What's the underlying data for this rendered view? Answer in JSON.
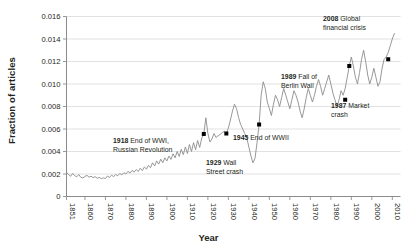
{
  "chart_data": {
    "type": "line",
    "title": "",
    "xlabel": "Year",
    "ylabel": "Fraction of articles",
    "xlim": [
      1851,
      2014
    ],
    "ylim": [
      0,
      0.016
    ],
    "grid": true,
    "legend": "none",
    "yticks": [
      "0",
      "0.002",
      "0.004",
      "0.006",
      "0.008",
      "0.010",
      "0.012",
      "0.014",
      "0.016"
    ],
    "ytick_values": [
      0,
      0.002,
      0.004,
      0.006,
      0.008,
      0.01,
      0.012,
      0.014,
      0.016
    ],
    "xticks": [
      "1851",
      "1860",
      "1870",
      "1880",
      "1890",
      "1900",
      "1910",
      "1920",
      "1930",
      "1940",
      "1950",
      "1960",
      "1970",
      "1980",
      "1990",
      "2000",
      "2010"
    ],
    "xtick_values": [
      1851,
      1860,
      1870,
      1880,
      1890,
      1900,
      1910,
      1920,
      1930,
      1940,
      1950,
      1960,
      1970,
      1980,
      1990,
      2000,
      2010
    ],
    "line_color": "#8c8c8c",
    "marker_color": "#000000",
    "x": [
      1851,
      1852,
      1853,
      1854,
      1855,
      1856,
      1857,
      1858,
      1859,
      1860,
      1861,
      1862,
      1863,
      1864,
      1865,
      1866,
      1867,
      1868,
      1869,
      1870,
      1871,
      1872,
      1873,
      1874,
      1875,
      1876,
      1877,
      1878,
      1879,
      1880,
      1881,
      1882,
      1883,
      1884,
      1885,
      1886,
      1887,
      1888,
      1889,
      1890,
      1891,
      1892,
      1893,
      1894,
      1895,
      1896,
      1897,
      1898,
      1899,
      1900,
      1901,
      1902,
      1903,
      1904,
      1905,
      1906,
      1907,
      1908,
      1909,
      1910,
      1911,
      1912,
      1913,
      1914,
      1915,
      1916,
      1917,
      1918,
      1919,
      1920,
      1921,
      1922,
      1923,
      1924,
      1925,
      1926,
      1927,
      1928,
      1929,
      1930,
      1931,
      1932,
      1933,
      1934,
      1935,
      1936,
      1937,
      1938,
      1939,
      1940,
      1941,
      1942,
      1943,
      1944,
      1945,
      1946,
      1947,
      1948,
      1949,
      1950,
      1951,
      1952,
      1953,
      1954,
      1955,
      1956,
      1957,
      1958,
      1959,
      1960,
      1961,
      1962,
      1963,
      1964,
      1965,
      1966,
      1967,
      1968,
      1969,
      1970,
      1971,
      1972,
      1973,
      1974,
      1975,
      1976,
      1977,
      1978,
      1979,
      1980,
      1981,
      1982,
      1983,
      1984,
      1985,
      1986,
      1987,
      1988,
      1989,
      1990,
      1991,
      1992,
      1993,
      1994,
      1995,
      1996,
      1997,
      1998,
      1999,
      2000,
      2001,
      2002,
      2003,
      2004,
      2005,
      2006,
      2007,
      2008,
      2009,
      2010,
      2011,
      2012,
      2013
    ],
    "y": [
      0.00215,
      0.00195,
      0.0018,
      0.00205,
      0.00185,
      0.00175,
      0.00195,
      0.0017,
      0.00165,
      0.00178,
      0.00188,
      0.00172,
      0.0018,
      0.00168,
      0.00176,
      0.00162,
      0.0017,
      0.00158,
      0.00166,
      0.0016,
      0.00182,
      0.0017,
      0.0019,
      0.00176,
      0.00196,
      0.00184,
      0.00205,
      0.00192,
      0.00212,
      0.002,
      0.00224,
      0.00208,
      0.00232,
      0.00216,
      0.0024,
      0.00222,
      0.00252,
      0.0023,
      0.00262,
      0.00244,
      0.00276,
      0.00256,
      0.003,
      0.00272,
      0.00316,
      0.00288,
      0.00332,
      0.003,
      0.00344,
      0.00316,
      0.0036,
      0.0033,
      0.0038,
      0.00344,
      0.004,
      0.00356,
      0.0042,
      0.00372,
      0.0044,
      0.00382,
      0.00462,
      0.004,
      0.00478,
      0.00416,
      0.00498,
      0.00436,
      0.0052,
      0.00556,
      0.007,
      0.0056,
      0.00484,
      0.00512,
      0.0056,
      0.00524,
      0.0054,
      0.00552,
      0.00568,
      0.0058,
      0.0056,
      0.0061,
      0.0068,
      0.0076,
      0.0082,
      0.0078,
      0.007,
      0.0064,
      0.006,
      0.0056,
      0.0052,
      0.0044,
      0.0036,
      0.003,
      0.0034,
      0.0048,
      0.0064,
      0.009,
      0.0102,
      0.0096,
      0.0084,
      0.0078,
      0.0072,
      0.0082,
      0.009,
      0.0086,
      0.008,
      0.0088,
      0.0096,
      0.009,
      0.0084,
      0.0078,
      0.0086,
      0.0094,
      0.009,
      0.0084,
      0.0076,
      0.007,
      0.0078,
      0.0088,
      0.0096,
      0.009,
      0.0084,
      0.009,
      0.0098,
      0.0104,
      0.0098,
      0.009,
      0.0096,
      0.0102,
      0.0108,
      0.01,
      0.0092,
      0.0086,
      0.008,
      0.0086,
      0.0094,
      0.009,
      0.0096,
      0.0106,
      0.0116,
      0.0124,
      0.0116,
      0.0106,
      0.01,
      0.011,
      0.0122,
      0.013,
      0.012,
      0.0108,
      0.01,
      0.0106,
      0.0114,
      0.0106,
      0.0098,
      0.0102,
      0.0114,
      0.0122,
      0.0124,
      0.0128,
      0.0134,
      0.014,
      0.0145
    ],
    "annotations": [
      {
        "year": 1918,
        "value": 0.00556,
        "bold": "1918",
        "text": "End of WWI,",
        "text2": "Russian Revolution"
      },
      {
        "year": 1929,
        "value": 0.0056,
        "bold": "1929",
        "text": "Wall",
        "text2": "Street crash"
      },
      {
        "year": 1945,
        "value": 0.0064,
        "bold": "1945",
        "text": "End of WWII",
        "text2": ""
      },
      {
        "year": 1987,
        "value": 0.0086,
        "bold": "1987",
        "text": "Market",
        "text2": "crash"
      },
      {
        "year": 1989,
        "value": 0.0116,
        "bold": "1989",
        "text": "Fall of",
        "text2": "Berlin Wall"
      },
      {
        "year": 2008,
        "value": 0.0122,
        "bold": "2008",
        "text": "Global",
        "text2": "financial crisis"
      }
    ]
  },
  "axis": {
    "ylabel": "Fraction of articles",
    "xlabel": "Year"
  }
}
